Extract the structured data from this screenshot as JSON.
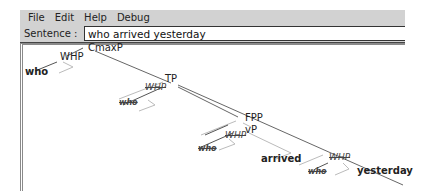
{
  "menu": {
    "items": [
      "File",
      "Edit",
      "Help",
      "Debug"
    ]
  },
  "sentence": {
    "label": "Sentence :",
    "value": "who arrived yesterday"
  },
  "tree": {
    "nodes": {
      "cmaxp": "CmaxP",
      "whp_top": "WHP",
      "who_top": "who",
      "tp": "TP",
      "whp_tp": "WHP",
      "who_tp": "who",
      "fpp": "FPP",
      "vp": "vP",
      "whp_vp": "WHP",
      "who_vp": "who",
      "arrived": "arrived",
      "whp_adj": "WHP",
      "who_adj": "who",
      "yesterday": "yesterday"
    },
    "colors": {
      "line_dark": "#555555",
      "line_light": "#bbbbbb"
    }
  }
}
